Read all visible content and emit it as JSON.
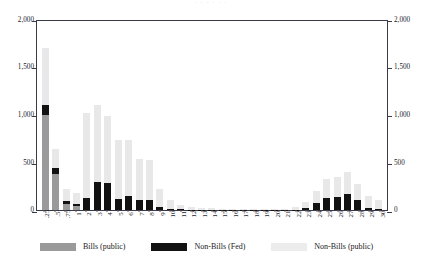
{
  "top_strip_text": "· · · · · ·",
  "legend": {
    "items": [
      {
        "key": "bills_public",
        "label": "Bills (public)",
        "color": "#9a9a9a"
      },
      {
        "key": "nonbills_fed",
        "label": "Non-Bills (Fed)",
        "color": "#121212"
      },
      {
        "key": "nonbills_public",
        "label": "Non-Bills (public)",
        "color": "#ececec"
      }
    ]
  },
  "axes": {
    "y_left_ticks": [
      "0",
      "500",
      "1,000",
      "1,500",
      "2,000"
    ],
    "y_right_ticks": [
      "0",
      "500",
      "1,000",
      "1,500",
      "2,000"
    ],
    "y_min": 0,
    "y_max": 2000
  },
  "chart_data": {
    "type": "bar",
    "title": "",
    "subtitle": "",
    "xlabel": "",
    "ylabel": "",
    "stacked": true,
    "grid": false,
    "legend_position": "bottom",
    "ylim": [
      0,
      2000
    ],
    "yticks": [
      0,
      500,
      1000,
      1500,
      2000
    ],
    "ytick_labels": [
      "0",
      "500",
      "1,000",
      "1,500",
      "2,000"
    ],
    "y_axis_duplicated_right": true,
    "categories": [
      ".25",
      ".5",
      ".75",
      "1",
      "2",
      "3",
      "4",
      "5",
      "6",
      "7",
      "8",
      "9",
      "10",
      "11",
      "12",
      "13",
      "14",
      "15",
      "16",
      "17",
      "18",
      "19",
      "20",
      "21",
      "22",
      "23",
      "24",
      "25",
      "26",
      "27",
      "28",
      "29",
      "30"
    ],
    "series": [
      {
        "name": "Bills (public)",
        "color": "#9a9a9a",
        "values": [
          1000,
          380,
          60,
          40,
          0,
          0,
          0,
          0,
          0,
          0,
          0,
          0,
          0,
          0,
          0,
          0,
          0,
          0,
          0,
          0,
          0,
          0,
          0,
          0,
          0,
          0,
          0,
          0,
          0,
          0,
          0,
          0,
          0
        ]
      },
      {
        "name": "Non-Bills (Fed)",
        "color": "#121212",
        "values": [
          100,
          60,
          30,
          25,
          130,
          290,
          280,
          115,
          150,
          110,
          110,
          35,
          15,
          8,
          5,
          4,
          3,
          2,
          2,
          2,
          2,
          2,
          2,
          3,
          5,
          20,
          75,
          130,
          135,
          165,
          100,
          25,
          12
        ]
      },
      {
        "name": "Non-Bills (public)",
        "color": "#e8e8e8",
        "values": [
          600,
          200,
          130,
          115,
          890,
          810,
          700,
          620,
          580,
          420,
          410,
          185,
          95,
          40,
          25,
          18,
          14,
          10,
          8,
          8,
          8,
          8,
          8,
          12,
          25,
          65,
          125,
          190,
          215,
          235,
          170,
          120,
          95
        ]
      }
    ],
    "totals": [
      1700,
      640,
      220,
      180,
      1020,
      1100,
      980,
      735,
      730,
      530,
      520,
      220,
      110,
      48,
      30,
      22,
      17,
      12,
      10,
      10,
      10,
      10,
      10,
      15,
      30,
      85,
      200,
      320,
      350,
      400,
      270,
      145,
      107
    ]
  }
}
